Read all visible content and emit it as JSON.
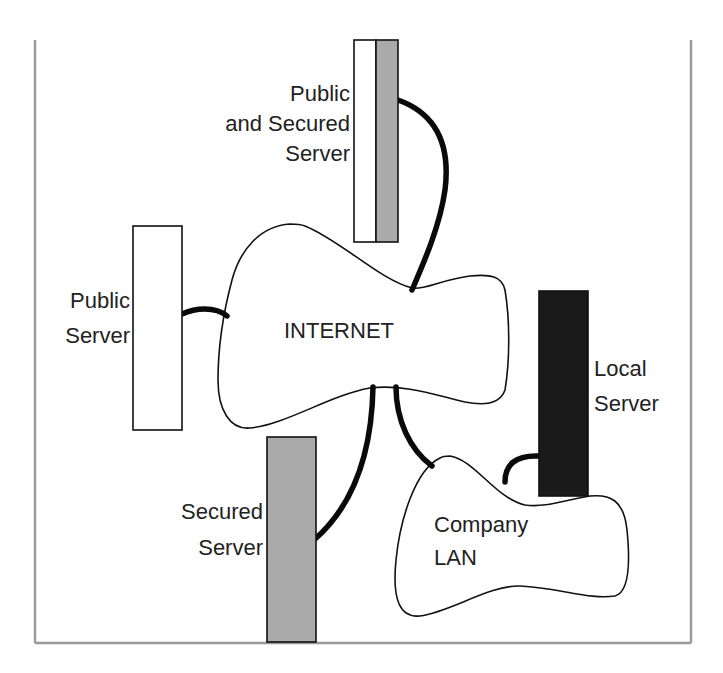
{
  "diagram": {
    "title": "",
    "colors": {
      "public": "#ffffff",
      "secured": "#aaaaaa",
      "local": "#1a1a1a",
      "frame": "#9a9a9a",
      "connector": "#0a0a0a"
    },
    "nodes": {
      "public_and_secured_server": {
        "label_line1": "Public",
        "label_line2": "and Secured",
        "label_line3": "Server"
      },
      "public_server": {
        "label_line1": "Public",
        "label_line2": "Server"
      },
      "internet": {
        "label": "INTERNET"
      },
      "local_server": {
        "label_line1": "Local",
        "label_line2": "Server"
      },
      "secured_server": {
        "label_line1": "Secured",
        "label_line2": "Server"
      },
      "company_lan": {
        "label_line1": "Company",
        "label_line2": "LAN"
      }
    },
    "edges": [
      {
        "from": "internet",
        "to": "public_and_secured_server"
      },
      {
        "from": "internet",
        "to": "public_server"
      },
      {
        "from": "internet",
        "to": "secured_server"
      },
      {
        "from": "internet",
        "to": "company_lan"
      },
      {
        "from": "company_lan",
        "to": "local_server"
      }
    ]
  }
}
